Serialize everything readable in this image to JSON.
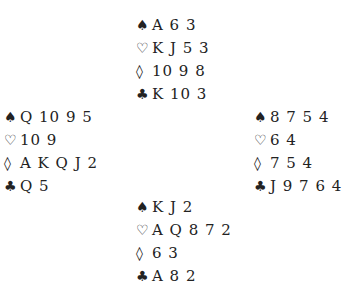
{
  "suits": {
    "spades": "♠",
    "hearts": "♡",
    "diamonds": "◊",
    "clubs": "♣"
  },
  "hands": {
    "north": {
      "spades": "A 6 3",
      "hearts": "K J 5 3",
      "diamonds": "10 9 8",
      "clubs": "K 10 3"
    },
    "west": {
      "spades": "Q 10 9 5",
      "hearts": "10 9",
      "diamonds": "A K Q J 2",
      "clubs": "Q 5"
    },
    "east": {
      "spades": "8 7 5 4",
      "hearts": "6 4",
      "diamonds": "7 5 4",
      "clubs": "J 9 7 6 4"
    },
    "south": {
      "spades": "K J 2",
      "hearts": "A Q 8 7 2",
      "diamonds": "6 3",
      "clubs": "A 8 2"
    }
  }
}
